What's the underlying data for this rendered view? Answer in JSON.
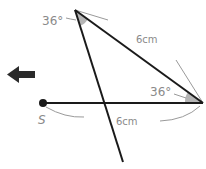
{
  "diagram": {
    "labels": {
      "top_angle": "36°",
      "right_angle": "36°",
      "slanted_side": "6cm",
      "base_side": "6cm",
      "point": "S"
    },
    "colors": {
      "line": "#1a1a1a",
      "annotation": "#8a8a8a",
      "angle_fill": "#b5b5b5",
      "arrow": "#2b2b2b"
    },
    "arrow_direction": "left"
  }
}
